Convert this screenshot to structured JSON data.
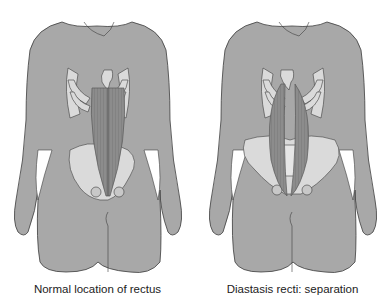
{
  "figures": [
    {
      "id": "normal",
      "caption": "Normal location of rectus",
      "condition": "normal"
    },
    {
      "id": "diastasis",
      "caption": "Diastasis recti: separation",
      "condition": "separated"
    }
  ],
  "colors": {
    "body": "#a8a8a8",
    "outline": "#3c3c3c",
    "muscle": "#8c8c8c",
    "muscle_line": "#6f6f6f",
    "bone": "#dadada",
    "background": "#ffffff"
  }
}
